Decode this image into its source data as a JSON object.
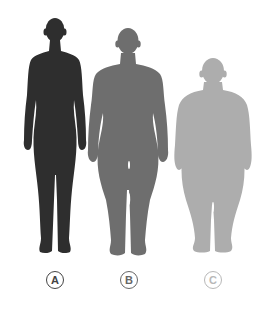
{
  "figures": [
    {
      "id": "A",
      "label": "A",
      "build": "slim",
      "fill": "#2e2e2e",
      "label_color": "#444444"
    },
    {
      "id": "B",
      "label": "B",
      "build": "athletic",
      "fill": "#6e6e6e",
      "label_color": "#666666"
    },
    {
      "id": "C",
      "label": "C",
      "build": "obese",
      "fill": "#adadad",
      "label_color": "#b0b0b0"
    }
  ]
}
